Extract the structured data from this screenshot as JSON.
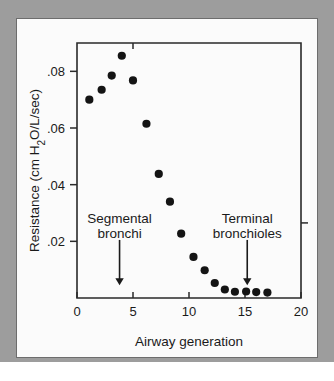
{
  "figure": {
    "background_color": "#9d9d9d",
    "card_color": "#fbfbfb",
    "point_color": "#141414",
    "axis_color": "#2a2a2a"
  },
  "chart_data": {
    "type": "scatter",
    "title": "",
    "xlabel": "Airway generation",
    "ylabel": "Resistance (cm H2O/L/sec)",
    "ylabel_display": "Resistance (cm H",
    "ylabel_sub": "2",
    "ylabel_tail": "O/L/sec)",
    "xlim": [
      0,
      20
    ],
    "ylim": [
      0,
      0.09
    ],
    "grid": false,
    "legend": "none",
    "xticks": [
      0,
      5,
      10,
      15,
      20
    ],
    "xtick_labels": [
      "0",
      "5",
      "10",
      "15",
      "20"
    ],
    "yticks": [
      0.02,
      0.04,
      0.06,
      0.08
    ],
    "ytick_labels": [
      ".02",
      ".04",
      ".06",
      ".08"
    ],
    "x": [
      1.1,
      2.2,
      3.1,
      4.0,
      5.0,
      6.2,
      7.3,
      8.3,
      9.3,
      10.4,
      11.4,
      12.3,
      13.2,
      14.1,
      15.1,
      16.0,
      17.0
    ],
    "y": [
      0.07,
      0.0735,
      0.0785,
      0.0855,
      0.0768,
      0.0615,
      0.0438,
      0.034,
      0.0227,
      0.0145,
      0.0098,
      0.0053,
      0.003,
      0.0022,
      0.0023,
      0.0021,
      0.0019
    ],
    "annotations": [
      {
        "label_line1": "Segmental",
        "label_line2": "bronchi",
        "arrow_x": 3.8,
        "text_y": 0.0265,
        "arrow_from_y": 0.0205,
        "arrow_to_y": 0.0045
      },
      {
        "label_line1": "Terminal",
        "label_line2": "bronchioles",
        "arrow_x": 15.2,
        "text_y": 0.0265,
        "arrow_from_y": 0.0205,
        "arrow_to_y": 0.0045
      }
    ]
  }
}
